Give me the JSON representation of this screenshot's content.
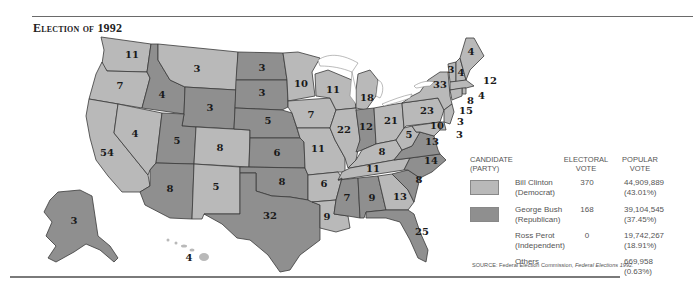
{
  "title": "Election of 1992",
  "colors": {
    "democrat": "#b9b9b9",
    "republican": "#8f8f8f",
    "water_lines": "#ffffff",
    "border": "#3a3a3a"
  },
  "legend": {
    "headers": {
      "candidate": "CANDIDATE",
      "party": "(PARTY)",
      "electoral_1": "ELECTORAL",
      "electoral_2": "VOTE",
      "popular_1": "POPULAR",
      "popular_2": "VOTE"
    },
    "rows": [
      {
        "name": "Bill Clinton",
        "party": "(Democrat)",
        "electoral": "370",
        "popular": "44,909,889",
        "percent": "(43.01%)",
        "swatch": "democrat"
      },
      {
        "name": "George Bush",
        "party": "(Republican)",
        "electoral": "168",
        "popular": "39,104,545",
        "percent": "(37.45%)",
        "swatch": "republican"
      },
      {
        "name": "Ross Perot",
        "party": "(Independent)",
        "electoral": "0",
        "popular": "19,742,267",
        "percent": "(18.91%)",
        "swatch": null
      },
      {
        "name": "Others",
        "party": "",
        "electoral": "",
        "popular": "669,958",
        "percent": "(0.63%)",
        "swatch": null
      }
    ]
  },
  "source": {
    "prefix": "SOURCE: ",
    "org": "Federal Election Commission, ",
    "publication": "Federal Elections 1992."
  },
  "states": [
    {
      "id": "WA",
      "ev": 11,
      "winner": "democrat"
    },
    {
      "id": "OR",
      "ev": 7,
      "winner": "democrat"
    },
    {
      "id": "CA",
      "ev": 54,
      "winner": "democrat"
    },
    {
      "id": "NV",
      "ev": 4,
      "winner": "democrat"
    },
    {
      "id": "ID",
      "ev": 4,
      "winner": "republican"
    },
    {
      "id": "MT",
      "ev": 3,
      "winner": "democrat"
    },
    {
      "id": "WY",
      "ev": 3,
      "winner": "republican"
    },
    {
      "id": "UT",
      "ev": 5,
      "winner": "republican"
    },
    {
      "id": "CO",
      "ev": 8,
      "winner": "democrat"
    },
    {
      "id": "AZ",
      "ev": 8,
      "winner": "republican"
    },
    {
      "id": "NM",
      "ev": 5,
      "winner": "democrat"
    },
    {
      "id": "ND",
      "ev": 3,
      "winner": "republican"
    },
    {
      "id": "SD",
      "ev": 3,
      "winner": "republican"
    },
    {
      "id": "NE",
      "ev": 5,
      "winner": "republican"
    },
    {
      "id": "KS",
      "ev": 6,
      "winner": "republican"
    },
    {
      "id": "OK",
      "ev": 8,
      "winner": "republican"
    },
    {
      "id": "TX",
      "ev": 32,
      "winner": "republican"
    },
    {
      "id": "MN",
      "ev": 10,
      "winner": "democrat"
    },
    {
      "id": "IA",
      "ev": 7,
      "winner": "democrat"
    },
    {
      "id": "MO",
      "ev": 11,
      "winner": "democrat"
    },
    {
      "id": "AR",
      "ev": 6,
      "winner": "democrat"
    },
    {
      "id": "LA",
      "ev": 9,
      "winner": "democrat"
    },
    {
      "id": "WI",
      "ev": 11,
      "winner": "democrat"
    },
    {
      "id": "IL",
      "ev": 22,
      "winner": "democrat"
    },
    {
      "id": "MI",
      "ev": 18,
      "winner": "democrat"
    },
    {
      "id": "IN",
      "ev": 12,
      "winner": "republican"
    },
    {
      "id": "OH",
      "ev": 21,
      "winner": "democrat"
    },
    {
      "id": "KY",
      "ev": 8,
      "winner": "democrat"
    },
    {
      "id": "TN",
      "ev": 11,
      "winner": "democrat"
    },
    {
      "id": "MS",
      "ev": 7,
      "winner": "republican"
    },
    {
      "id": "AL",
      "ev": 9,
      "winner": "republican"
    },
    {
      "id": "GA",
      "ev": 13,
      "winner": "democrat"
    },
    {
      "id": "FL",
      "ev": 25,
      "winner": "republican"
    },
    {
      "id": "SC",
      "ev": 8,
      "winner": "republican"
    },
    {
      "id": "NC",
      "ev": 14,
      "winner": "republican"
    },
    {
      "id": "VA",
      "ev": 13,
      "winner": "republican"
    },
    {
      "id": "WV",
      "ev": 5,
      "winner": "democrat"
    },
    {
      "id": "PA",
      "ev": 23,
      "winner": "democrat"
    },
    {
      "id": "NY",
      "ev": 33,
      "winner": "democrat"
    },
    {
      "id": "VT",
      "ev": 3,
      "winner": "democrat"
    },
    {
      "id": "NH",
      "ev": 4,
      "winner": "democrat"
    },
    {
      "id": "ME",
      "ev": 4,
      "winner": "democrat"
    },
    {
      "id": "MA",
      "ev": 12,
      "winner": "democrat"
    },
    {
      "id": "RI",
      "ev": 4,
      "winner": "democrat"
    },
    {
      "id": "CT",
      "ev": 8,
      "winner": "democrat"
    },
    {
      "id": "NJ",
      "ev": 15,
      "winner": "democrat"
    },
    {
      "id": "DE",
      "ev": 3,
      "winner": "democrat"
    },
    {
      "id": "MD",
      "ev": 10,
      "winner": "democrat"
    },
    {
      "id": "DC",
      "ev": 3,
      "winner": "democrat"
    },
    {
      "id": "AK",
      "ev": 3,
      "winner": "republican"
    },
    {
      "id": "HI",
      "ev": 4,
      "winner": "democrat"
    }
  ]
}
